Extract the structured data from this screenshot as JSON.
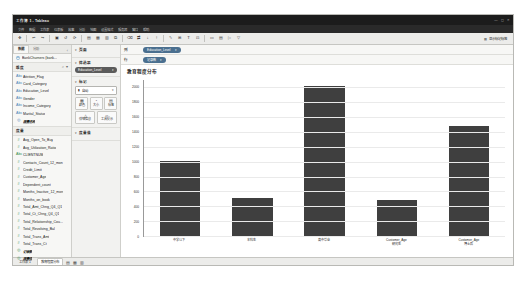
{
  "window": {
    "title": "工作簿 1 - Tableau",
    "minimize": "—",
    "maximize": "▢",
    "close": "✕"
  },
  "menu": {
    "items": [
      "文件",
      "数据",
      "工作表",
      "仪表板",
      "故事",
      "分析",
      "地图",
      "设置格式",
      "服务器",
      "窗口",
      "帮助"
    ]
  },
  "toolbar": {
    "buttons": [
      {
        "name": "tableau-logo",
        "glyph": "❖"
      },
      {
        "name": "back-arrow",
        "glyph": "↩"
      },
      {
        "name": "forward-arrow",
        "glyph": "↪"
      },
      {
        "name": "save",
        "glyph": "▣"
      },
      {
        "name": "undo-refresh",
        "glyph": "↺"
      },
      {
        "name": "refresh-data",
        "glyph": "⟳"
      },
      {
        "name": "new-worksheet",
        "glyph": "▤"
      },
      {
        "name": "new-dashboard",
        "glyph": "▦"
      },
      {
        "name": "new-story",
        "glyph": "▥"
      },
      {
        "name": "duplicate-sheet",
        "glyph": "⧉"
      },
      {
        "name": "clear-sheet",
        "glyph": "⌫"
      },
      {
        "name": "swap-rows-columns",
        "glyph": "⇄"
      },
      {
        "name": "sort-ascending",
        "glyph": "↓"
      },
      {
        "name": "sort-descending",
        "glyph": "↑"
      },
      {
        "name": "highlight",
        "glyph": "✎"
      },
      {
        "name": "group-members",
        "glyph": "⊞"
      },
      {
        "name": "show-labels",
        "glyph": "T"
      },
      {
        "name": "fix-axes",
        "glyph": "⊡"
      },
      {
        "name": "fit-selector",
        "glyph": "▭"
      },
      {
        "name": "show-cards",
        "glyph": "▤"
      },
      {
        "name": "presentation-mode",
        "glyph": "▷"
      },
      {
        "name": "show-me",
        "glyph": "▽"
      }
    ],
    "right_label": "显示标记标签"
  },
  "data_pane": {
    "tabs": [
      {
        "name": "data",
        "label": "数据"
      },
      {
        "name": "analytics",
        "label": "分析"
      }
    ],
    "collapse_glyph": "‹",
    "source": {
      "icon": "database-icon",
      "label": "BankChurners (bank..."
    },
    "dimensions": {
      "title": "维度",
      "search_glyph": "⌕",
      "sort_glyph": "▾",
      "items": [
        {
          "icon": "Abc",
          "label": "Attrition_Flag"
        },
        {
          "icon": "Abc",
          "label": "Card_Category"
        },
        {
          "icon": "Abc",
          "label": "Education_Level"
        },
        {
          "icon": "Abc",
          "label": "Gender"
        },
        {
          "icon": "Abc",
          "label": "Income_Category"
        },
        {
          "icon": "Abc",
          "label": "Marital_Status"
        },
        {
          "icon": "◎",
          "label": "度量名称",
          "italic": true
        }
      ]
    },
    "measures": {
      "title": "度量",
      "items": [
        {
          "icon": "#",
          "label": "Avg_Open_To_Buy"
        },
        {
          "icon": "#",
          "label": "Avg_Utilization_Ratio"
        },
        {
          "icon": "Abc",
          "label": "CLIENTNUM"
        },
        {
          "icon": "#",
          "label": "Contacts_Count_12_mon"
        },
        {
          "icon": "#",
          "label": "Credit_Limit"
        },
        {
          "icon": "#",
          "label": "Customer_Age"
        },
        {
          "icon": "#",
          "label": "Dependent_count"
        },
        {
          "icon": "#",
          "label": "Months_Inactive_12_mon"
        },
        {
          "icon": "#",
          "label": "Months_on_book"
        },
        {
          "icon": "#",
          "label": "Total_Amt_Chng_Q4_Q1"
        },
        {
          "icon": "#",
          "label": "Total_Ct_Chng_Q4_Q1"
        },
        {
          "icon": "#",
          "label": "Total_Relationship_Cou..."
        },
        {
          "icon": "#",
          "label": "Total_Revolving_Bal"
        },
        {
          "icon": "#",
          "label": "Total_Trans_Amt"
        },
        {
          "icon": "#",
          "label": "Total_Trans_Ct"
        },
        {
          "icon": "◎",
          "label": "记录数",
          "italic": true
        },
        {
          "icon": "◎",
          "label": "度量值",
          "italic": true
        }
      ]
    }
  },
  "middle_panel": {
    "pages": {
      "title": "页面",
      "caret": "▾"
    },
    "filters": {
      "title": "筛选器",
      "caret": "▾",
      "pill": {
        "label": "Education_Level",
        "caret": "▾"
      }
    },
    "marks": {
      "title": "标记",
      "caret": "▾",
      "type": {
        "icon": "▮",
        "label": "自动",
        "caret": "▾"
      },
      "buttons": [
        {
          "name": "color",
          "icon": "▦",
          "label": "颜色"
        },
        {
          "name": "size",
          "icon": "◔",
          "label": "大小"
        },
        {
          "name": "label",
          "icon": "▤",
          "label": "标签"
        },
        {
          "name": "detail",
          "icon": "△",
          "label": "详细信息"
        },
        {
          "name": "tooltip",
          "icon": "▱",
          "label": "工具提示"
        }
      ]
    },
    "measure_values": {
      "title": "度量值",
      "caret": "▾"
    }
  },
  "shelves": {
    "columns": {
      "label": "列",
      "pill": {
        "text": "Education_Level",
        "caret": "▾"
      }
    },
    "rows": {
      "label": "行",
      "pill": {
        "text": "记录数",
        "caret": "▾"
      }
    }
  },
  "sheet": {
    "title": "教育程度分布"
  },
  "chart_data": {
    "type": "bar",
    "title": "教育程度分布",
    "xlabel": "Education_Level",
    "ylabel": "记录数",
    "categories": [
      "中学以下",
      "本科生",
      "高中毕业",
      "Customer_Age 研究生",
      "Customer_Age 博士后"
    ],
    "values": [
      1013,
      516,
      2013,
      487,
      1487
    ],
    "ylim": [
      0,
      2100
    ],
    "yticks": [
      0,
      200,
      400,
      600,
      800,
      1000,
      1200,
      1400,
      1600,
      1800,
      2000
    ],
    "ytick_labels": [
      "0",
      "200",
      "400",
      "600",
      "800",
      "1000",
      "1200",
      "1400",
      "1600",
      "1800",
      "2000"
    ],
    "bar_color": "#3f3f3f",
    "grid": true,
    "legend": false
  },
  "status_bar": {
    "tabs": [
      {
        "name": "sheet-tab-1",
        "label": "工作表 1"
      },
      {
        "name": "sheet-tab-2",
        "label": "教育程度分布"
      }
    ],
    "controls": [
      {
        "name": "new-worksheet-icon",
        "glyph": "▤"
      },
      {
        "name": "new-dashboard-icon",
        "glyph": "▦"
      },
      {
        "name": "new-story-icon",
        "glyph": "▥"
      }
    ]
  }
}
